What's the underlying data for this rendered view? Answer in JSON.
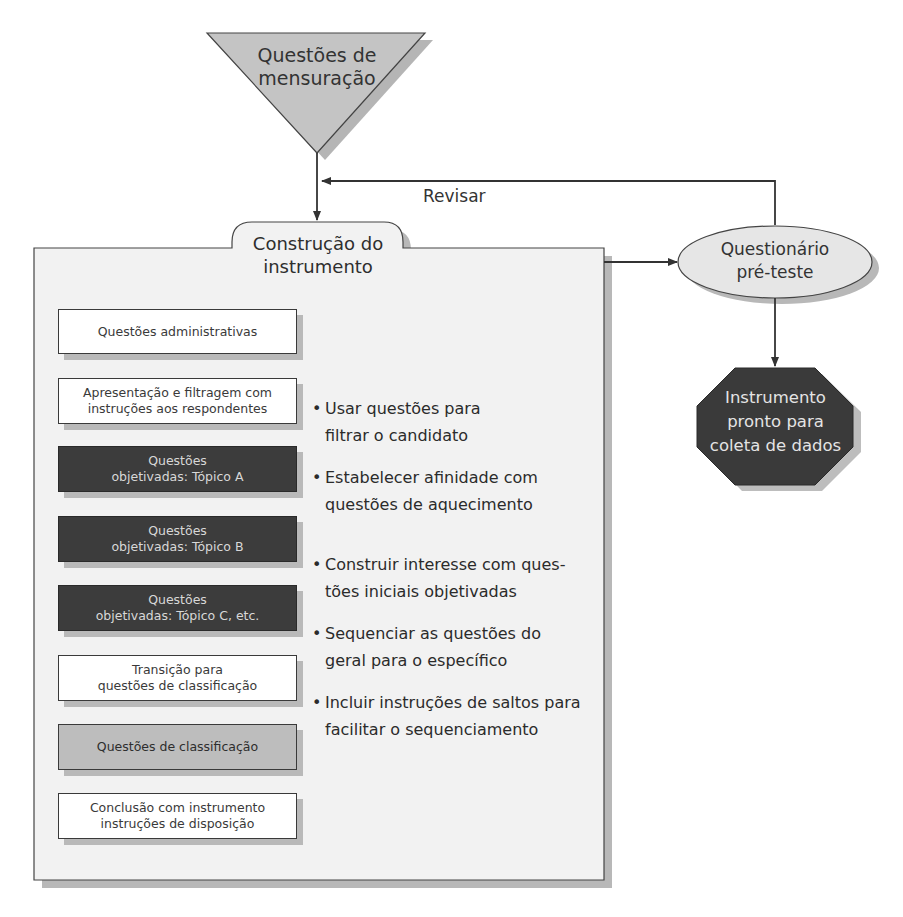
{
  "diagram": {
    "start_node": {
      "shape": "inverted-triangle",
      "label_line1": "Questões de",
      "label_line2": "mensuração",
      "fill": "#c4c4c4"
    },
    "revise_loop": {
      "label": "Revisar"
    },
    "container": {
      "title_line1": "Construção do",
      "title_line2": "instrumento",
      "fill": "#f2f2f2",
      "boxes": [
        {
          "line1": "Questões administrativas",
          "line2": "",
          "style": "white"
        },
        {
          "line1": "Apresentação e filtragem com",
          "line2": "instruções aos respondentes",
          "style": "white"
        },
        {
          "line1": "Questões",
          "line2": "objetivadas: Tópico A",
          "style": "dark"
        },
        {
          "line1": "Questões",
          "line2": "objetivadas: Tópico B",
          "style": "dark"
        },
        {
          "line1": "Questões",
          "line2": "objetivadas: Tópico C, etc.",
          "style": "dark"
        },
        {
          "line1": "Transição para",
          "line2": "questões de classificação",
          "style": "white"
        },
        {
          "line1": "Questões de classificação",
          "line2": "",
          "style": "gray"
        },
        {
          "line1": "Conclusão com instrumento",
          "line2": "instruções de disposição",
          "style": "white"
        }
      ],
      "bullets": [
        {
          "line1": "Usar questões para",
          "line2": "filtrar o candidato"
        },
        {
          "line1": "Estabelecer afinidade com",
          "line2": "questões de aquecimento"
        },
        {
          "line1": "Construir interesse com ques-",
          "line2": "tões iniciais objetivadas"
        },
        {
          "line1": "Sequenciar as questões do",
          "line2": "geral para o específico"
        },
        {
          "line1": "Incluir instruções de saltos para",
          "line2": "facilitar o sequenciamento"
        }
      ],
      "bullet_glyph": "•"
    },
    "pretest_node": {
      "shape": "ellipse",
      "label_line1": "Questionário",
      "label_line2": "pré-teste",
      "fill": "#e6e6e6"
    },
    "end_node": {
      "shape": "octagon",
      "label_line1": "Instrumento",
      "label_line2": "pronto para",
      "label_line3": "coleta de dados",
      "fill": "#3a3a3a"
    },
    "colors": {
      "line": "#333333",
      "shadow": "#b5b5b5",
      "dark_box": "#3c3c3c",
      "gray_box": "#bdbdbd"
    }
  }
}
